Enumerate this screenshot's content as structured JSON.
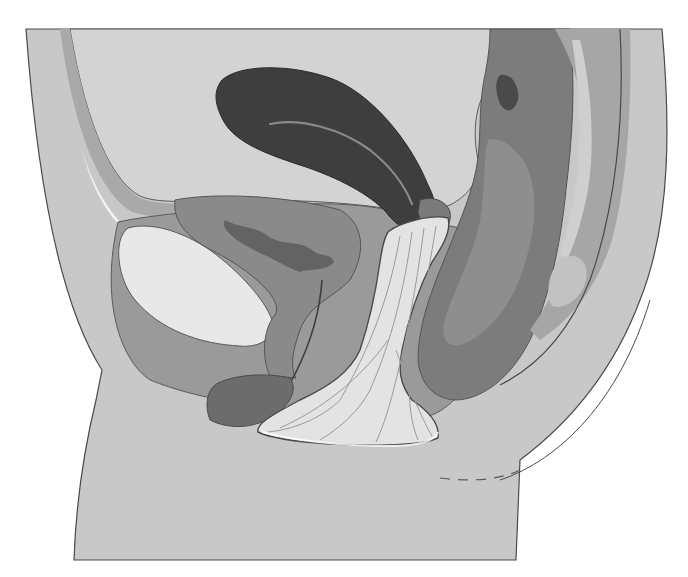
{
  "figure": {
    "kind": "anatomical-illustration",
    "view": "sagittal cross-section",
    "style": "grayscale",
    "labels": [],
    "structures": [
      {
        "id": "outer-body",
        "fill": "#c9c9c9"
      },
      {
        "id": "abdominal-cavity",
        "fill": "#d2d2d2"
      },
      {
        "id": "pubic-bone",
        "fill": "#e6e6e6"
      },
      {
        "id": "bladder",
        "fill": "#8a8a8a"
      },
      {
        "id": "bladder-lumen",
        "fill": "#6a6a6a"
      },
      {
        "id": "uterus",
        "fill": "#3e3e3e"
      },
      {
        "id": "vaginal-device",
        "fill": "#e2e2e2"
      },
      {
        "id": "rectum",
        "fill": "#7c7c7c"
      },
      {
        "id": "sacral-wall",
        "fill": "#a8a8a8"
      }
    ],
    "colors": {
      "background": "#ffffff",
      "outline": "#4a4a4a",
      "skin": "#c9c9c9",
      "cavity": "#d4d4d4",
      "darkOrgan": "#3e3e3e",
      "midOrgan": "#8a8a8a",
      "lightBone": "#e8e8e8"
    }
  }
}
